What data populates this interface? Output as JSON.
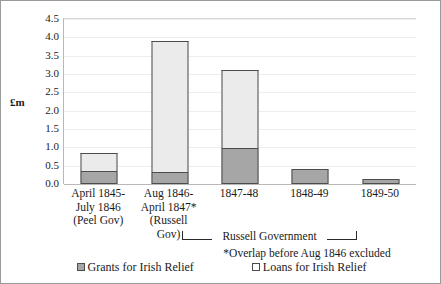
{
  "chart_data": {
    "type": "bar",
    "subtype": "stacked-vertical",
    "title": "",
    "xlabel": "",
    "ylabel": "£m",
    "ylim": [
      0.0,
      4.5
    ],
    "ytick_step": 0.5,
    "yticks": [
      "4.5",
      "4.0",
      "3.5",
      "3.0",
      "2.5",
      "2.0",
      "1.5",
      "1.0",
      "0.5",
      "0.0"
    ],
    "grid": true,
    "legend_position": "bottom",
    "categories": [
      "April 1845-\nJuly 1846\n(Peel Gov)",
      "Aug 1846-\nApril 1847*\n(Russell Gov)",
      "1847-48",
      "1848-49",
      "1849-50"
    ],
    "category_lines": [
      [
        "April 1845-",
        "July 1846",
        "(Peel Gov)"
      ],
      [
        "Aug 1846-",
        "April 1847*",
        "(Russell",
        "Gov)"
      ],
      [
        "1847-48"
      ],
      [
        "1848-49"
      ],
      [
        "1849-50"
      ]
    ],
    "series": [
      {
        "name": "Grants for Irish Relief",
        "color": "#a6a6a6",
        "values": [
          0.35,
          0.32,
          0.98,
          0.42,
          0.13
        ]
      },
      {
        "name": "Loans for Irish Relief",
        "color": "#ebebeb",
        "values": [
          0.5,
          3.58,
          2.13,
          0.0,
          0.0
        ]
      }
    ],
    "totals": [
      0.85,
      3.9,
      3.11,
      0.42,
      0.13
    ],
    "annotations": [
      {
        "id": "bracket",
        "text": "Russell Government",
        "covers": [
          "1847-48",
          "1848-49",
          "1849-50"
        ]
      },
      {
        "id": "footnote",
        "text": "*Overlap before Aug 1846 excluded"
      }
    ]
  },
  "legend": {
    "items": [
      {
        "label": "Grants for Irish Relief",
        "swatch": "grants-swatch"
      },
      {
        "label": "Loans for Irish Relief",
        "swatch": "loans-swatch"
      }
    ]
  }
}
